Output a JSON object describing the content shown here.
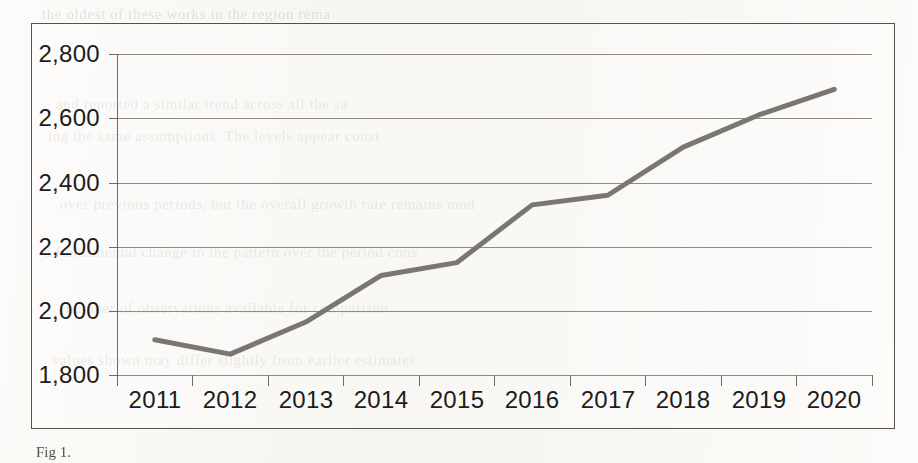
{
  "chart_data": {
    "type": "line",
    "title": "",
    "xlabel": "",
    "ylabel": "",
    "categories": [
      "2011",
      "2012",
      "2013",
      "2014",
      "2015",
      "2016",
      "2017",
      "2018",
      "2019",
      "2020"
    ],
    "series": [
      {
        "name": "series-1",
        "values": [
          1910,
          1865,
          1965,
          2110,
          2150,
          2330,
          2360,
          2510,
          2610,
          2690
        ],
        "color": "#7a7772",
        "line_width": 5,
        "markers": false
      }
    ],
    "ylim": [
      1800,
      2800
    ],
    "ytick_values": [
      1800,
      2000,
      2200,
      2400,
      2600,
      2800
    ],
    "ytick_labels": [
      "1,800",
      "2,000",
      "2,200",
      "2,400",
      "2,600",
      "2,800"
    ],
    "xtick_labels": [
      "2011",
      "2012",
      "2013",
      "2014",
      "2015",
      "2016",
      "2017",
      "2018",
      "2019",
      "2020"
    ],
    "grid": true,
    "grid_axis": "y",
    "legend": false,
    "legend_position": "none",
    "border": true,
    "plot_background": "#ffffff"
  },
  "figure": {
    "caption": "Fig 1.",
    "frame_color": "#55524c",
    "axis_color": "#6f6b64",
    "text_color": "#1d1c1b"
  },
  "scan_artifacts": {
    "ghost_text_lines": [
      "the  oldest  of  these  works  in  the  region  rema",
      "and  reported  a  similar  trend  across  all  the  sa",
      "ing  the  same  assumptions.  The  levels  appear  consi",
      "over  previous  periods,  but  the  overall  growth  rate  remains  mod",
      "a  fundamental  change  in  the  pattern  over  the  period  cons",
      "number  of  observations  available  for  comparison",
      "values  shown  may  differ  slightly  from  earlier  estimates"
    ]
  }
}
